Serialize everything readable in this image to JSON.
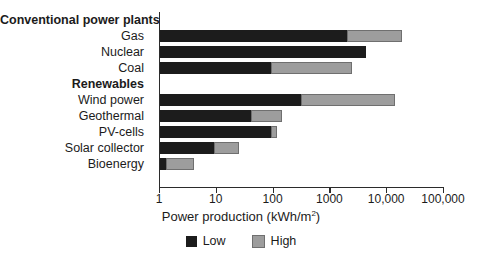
{
  "chart_data": {
    "type": "bar",
    "orientation": "horizontal",
    "scale": "log",
    "title": "",
    "xlabel": "Power production (kWh/m²)",
    "ylabel": "",
    "xlim": [
      1,
      100000
    ],
    "grid": false,
    "legend_position": "bottom-center",
    "tick_labels": [
      "1",
      "10",
      "100",
      "1000",
      "10,000",
      "100,000"
    ],
    "tick_values": [
      1,
      10,
      100,
      1000,
      10000,
      100000
    ],
    "series": [
      {
        "name": "Low",
        "color": "#1c1c1c"
      },
      {
        "name": "High",
        "color": "#9d9d9d"
      }
    ],
    "groups": [
      {
        "label": "Conventional power plants",
        "is_header": true
      },
      {
        "label": "Gas",
        "is_header": false,
        "low": 2000,
        "high": 18000
      },
      {
        "label": "Nuclear",
        "is_header": false,
        "low": 4300,
        "high": 4300
      },
      {
        "label": "Coal",
        "is_header": false,
        "low": 90,
        "high": 2400
      },
      {
        "label": "Renewables",
        "is_header": true
      },
      {
        "label": "Wind power",
        "is_header": false,
        "low": 300,
        "high": 14000
      },
      {
        "label": "Geothermal",
        "is_header": false,
        "low": 40,
        "high": 140
      },
      {
        "label": "PV-cells",
        "is_header": false,
        "low": 90,
        "high": 115
      },
      {
        "label": "Solar collector",
        "is_header": false,
        "low": 9,
        "high": 25
      },
      {
        "label": "Bioenergy",
        "is_header": false,
        "low": 1.3,
        "high": 4
      }
    ]
  },
  "legend": {
    "items": [
      {
        "label": "Low",
        "swatch": "low-swatch"
      },
      {
        "label": "High",
        "swatch": "high-swatch"
      }
    ]
  },
  "axis": {
    "title": "Power production (kWh/m",
    "title_sup": "2",
    "title_tail": ")"
  }
}
